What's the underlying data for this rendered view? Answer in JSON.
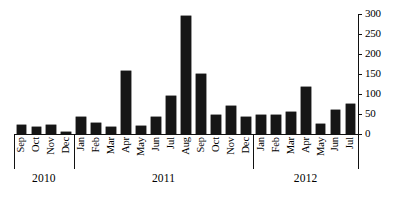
{
  "chart_data": {
    "type": "bar",
    "title": "",
    "subtitle": "",
    "xlabel": "",
    "ylabel": "",
    "ylim": [
      0,
      300
    ],
    "grid": false,
    "legend": false,
    "y_axis_position": "right",
    "x_axis_position": "bottom",
    "bar_color": "#161616",
    "axis_color": "#111111",
    "y_ticks": [
      0,
      50,
      100,
      150,
      200,
      250,
      300
    ],
    "y_tick_labels": [
      "0",
      "50",
      "100",
      "150",
      "200",
      "250",
      "300"
    ],
    "categories": [
      "Sep",
      "Oct",
      "Nov",
      "Dec",
      "Jan",
      "Feb",
      "Mar",
      "Apr",
      "May",
      "Jun",
      "Jul",
      "Aug",
      "Sep",
      "Oct",
      "Nov",
      "Dec",
      "Jan",
      "Feb",
      "Mar",
      "Apr",
      "May",
      "Jun",
      "Jul"
    ],
    "values": [
      22,
      18,
      22,
      5,
      42,
      28,
      18,
      158,
      20,
      43,
      95,
      295,
      150,
      48,
      69,
      43,
      48,
      48,
      55,
      118,
      25,
      60,
      75
    ],
    "groups": [
      {
        "label": "2010",
        "start_index": 0,
        "count": 4
      },
      {
        "label": "2011",
        "start_index": 4,
        "count": 12
      },
      {
        "label": "2012",
        "start_index": 16,
        "count": 7
      }
    ]
  }
}
